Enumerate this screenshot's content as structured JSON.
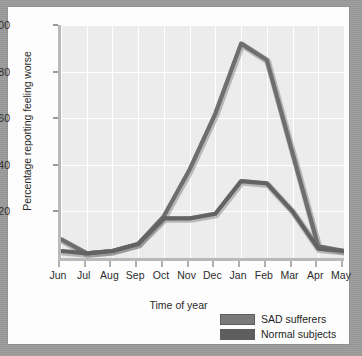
{
  "chart_data": {
    "type": "line",
    "title": "",
    "subtitle": "",
    "xlabel": "Time of year",
    "ylabel": "Percentage reporting feeling worse",
    "categories": [
      "Jun",
      "Jul",
      "Aug",
      "Sep",
      "Oct",
      "Nov",
      "Dec",
      "Jan",
      "Feb",
      "Mar",
      "Apr",
      "May"
    ],
    "xlim": [
      0,
      11
    ],
    "ylim": [
      0,
      100
    ],
    "yticks": [
      20,
      40,
      60,
      80,
      100
    ],
    "ytick_labels": [
      "20",
      "40",
      "60",
      "80",
      "100"
    ],
    "grid": true,
    "legend_position": "bottom-right",
    "series": [
      {
        "name": "SAD sufferers",
        "color": "#6e6e6e",
        "values": [
          8,
          2,
          3,
          6,
          18,
          38,
          62,
          92,
          85,
          45,
          5,
          3
        ]
      },
      {
        "name": "Normal subjects",
        "color": "#636363",
        "values": [
          3,
          2,
          3,
          6,
          17,
          17,
          19,
          33,
          32,
          20,
          4,
          3
        ]
      }
    ]
  },
  "legend": {
    "items": [
      {
        "label": "SAD sufferers",
        "color": "#7a7a7a"
      },
      {
        "label": "Normal subjects",
        "color": "#5e5e5e"
      }
    ]
  },
  "colors": {
    "page_background": "#9b9b9b",
    "card_background": "#fdfdfd",
    "plot_background": "#ececec",
    "gridline": "#ffffff",
    "axis": "#b9b9b9",
    "text": "#2a2a2a"
  }
}
